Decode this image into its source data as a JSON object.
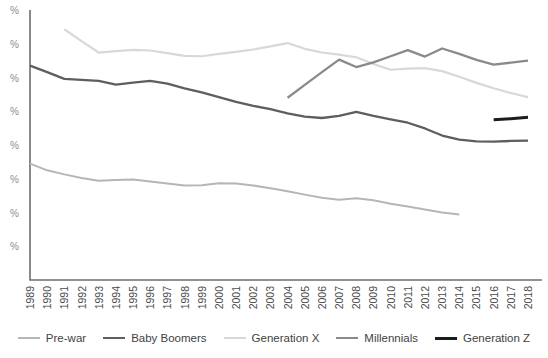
{
  "chart_data": {
    "type": "line",
    "title": "",
    "subtitle": "",
    "xlabel": "",
    "ylabel": "",
    "grid": false,
    "legend_position": "bottom",
    "x": [
      1989,
      1990,
      1991,
      1992,
      1993,
      1994,
      1995,
      1996,
      1997,
      1998,
      1999,
      2000,
      2001,
      2002,
      2003,
      2004,
      2005,
      2006,
      2007,
      2008,
      2009,
      2010,
      2011,
      2012,
      2013,
      2014,
      2015,
      2016,
      2017,
      2018
    ],
    "xtick_labels": [
      "1989",
      "1990",
      "1991",
      "1992",
      "1993",
      "1994",
      "1995",
      "1996",
      "1997",
      "1998",
      "1999",
      "2000",
      "2001",
      "2002",
      "2003",
      "2004",
      "2005",
      "2006",
      "2007",
      "2008",
      "2009",
      "2010",
      "2011",
      "2012",
      "2013",
      "2014",
      "2015",
      "2016",
      "2017",
      "2018"
    ],
    "ytick_labels": [
      "%",
      "%",
      "%",
      "%",
      "%",
      "%",
      "%",
      "%"
    ],
    "ylim": [
      0,
      80
    ],
    "ytick_values": [
      80,
      70,
      60,
      50,
      40,
      30,
      20,
      10
    ],
    "series": [
      {
        "name": "Pre-war",
        "color": "#b6b6b6",
        "width": 2.0,
        "x": [
          1989,
          1990,
          1991,
          1992,
          1993,
          1994,
          1995,
          1996,
          1997,
          1998,
          1999,
          2000,
          2001,
          2002,
          2003,
          2004,
          2005,
          2006,
          2007,
          2008,
          2009,
          2010,
          2011,
          2012,
          2013,
          2014
        ],
        "values": [
          34.5,
          32.5,
          31.3,
          30.2,
          29.4,
          29.6,
          29.8,
          29.2,
          28.6,
          28.0,
          28.1,
          28.7,
          28.6,
          28.0,
          27.2,
          26.3,
          25.3,
          24.4,
          23.8,
          24.2,
          23.6,
          22.6,
          21.8,
          20.9,
          20.0,
          19.4
        ]
      },
      {
        "name": "Baby Boomers",
        "color": "#5e5e5e",
        "width": 2.3,
        "x": [
          1989,
          1990,
          1991,
          1992,
          1993,
          1994,
          1995,
          1996,
          1997,
          1998,
          1999,
          2000,
          2001,
          2002,
          2003,
          2004,
          2005,
          2006,
          2007,
          2008,
          2009,
          2010,
          2011,
          2012,
          2013,
          2014,
          2015,
          2016,
          2017,
          2018
        ],
        "values": [
          63.5,
          61.6,
          59.6,
          59.3,
          59.0,
          57.9,
          58.5,
          59.0,
          58.2,
          56.8,
          55.6,
          54.2,
          52.8,
          51.6,
          50.6,
          49.4,
          48.4,
          48.0,
          48.6,
          49.8,
          48.6,
          47.6,
          46.6,
          44.9,
          42.8,
          41.6,
          41.1,
          41.0,
          41.2,
          41.3
        ]
      },
      {
        "name": "Generation X",
        "color": "#d8d8d8",
        "width": 2.2,
        "x": [
          1991,
          1992,
          1993,
          1994,
          1995,
          1996,
          1997,
          1998,
          1999,
          2000,
          2001,
          2002,
          2003,
          2004,
          2005,
          2006,
          2007,
          2008,
          2009,
          2010,
          2011,
          2012,
          2013,
          2014,
          2015,
          2016,
          2017,
          2018
        ],
        "values": [
          74.3,
          70.8,
          67.4,
          67.8,
          68.2,
          68.0,
          67.2,
          66.4,
          66.3,
          67.0,
          67.6,
          68.3,
          69.2,
          70.2,
          68.5,
          67.4,
          66.8,
          66.0,
          64.0,
          62.3,
          62.6,
          62.8,
          61.9,
          60.2,
          58.4,
          56.8,
          55.4,
          54.2
        ]
      },
      {
        "name": "Millennials",
        "color": "#8a8a8a",
        "width": 2.3,
        "x": [
          2004,
          2005,
          2006,
          2007,
          2008,
          2009,
          2010,
          2011,
          2012,
          2013,
          2014,
          2015,
          2016,
          2017,
          2018
        ],
        "values": [
          54.0,
          57.8,
          61.6,
          65.3,
          63.1,
          64.5,
          66.3,
          68.1,
          66.2,
          68.6,
          67.0,
          65.2,
          63.8,
          64.4,
          65.0
        ]
      },
      {
        "name": "Generation Z",
        "color": "#1c1c1c",
        "width": 3.0,
        "x": [
          2016,
          2017,
          2018
        ],
        "values": [
          47.5,
          47.8,
          48.2
        ]
      }
    ]
  },
  "legend": {
    "items": [
      {
        "label": "Pre-war",
        "color": "#b6b6b6",
        "width": 2.0
      },
      {
        "label": "Baby Boomers",
        "color": "#5e5e5e",
        "width": 2.6
      },
      {
        "label": "Generation X",
        "color": "#d8d8d8",
        "width": 2.2
      },
      {
        "label": "Millennials",
        "color": "#8a8a8a",
        "width": 2.4
      },
      {
        "label": "Generation Z",
        "color": "#1c1c1c",
        "width": 3.4
      }
    ]
  },
  "axes": {
    "axis_color": "#6e6e6e",
    "xtick_label_color": "#4a4a4a",
    "ytick_label_color": "#8d8d8d"
  }
}
